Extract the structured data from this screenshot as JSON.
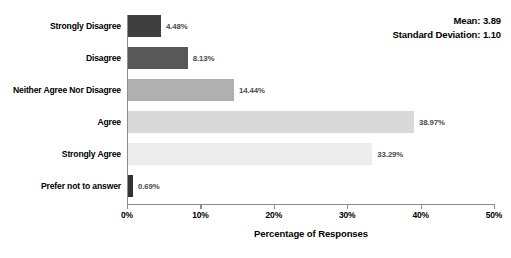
{
  "chart_data": {
    "type": "bar",
    "orientation": "horizontal",
    "title": "",
    "xlabel": "Percentage of Responses",
    "ylabel": "",
    "xlim": [
      0,
      50
    ],
    "grid": false,
    "legend": null,
    "categories": [
      "Strongly Disagree",
      "Disagree",
      "Neither Agree Nor Disagree",
      "Agree",
      "Strongly Agree",
      "Prefer not to answer"
    ],
    "values": [
      4.48,
      8.13,
      14.44,
      38.97,
      33.29,
      0.69
    ],
    "data_labels": [
      "4.48%",
      "8.13%",
      "14.44%",
      "38.97%",
      "33.29%",
      "0.69%"
    ],
    "bar_colors": [
      "#3f3f3f",
      "#585858",
      "#b0b0b0",
      "#d9d9d9",
      "#ededed",
      "#333333"
    ],
    "xticks": [
      0,
      10,
      20,
      30,
      40,
      50
    ],
    "xtick_labels": [
      "0%",
      "10%",
      "20%",
      "30%",
      "40%",
      "50%"
    ],
    "annotations": {
      "mean": "Mean: 3.89",
      "standard_deviation": "Standard Deviation: 1.10"
    }
  },
  "axis": {
    "line_color": "#8c8c8c"
  }
}
